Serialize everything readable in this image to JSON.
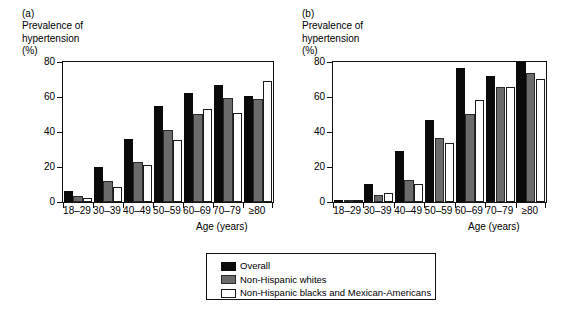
{
  "figure": {
    "legend": {
      "items": [
        {
          "key": "overall",
          "label": "Overall",
          "color": "#0a0a0a"
        },
        {
          "key": "whites",
          "label": "Non-Hispanic whites",
          "color": "#6b6b6b"
        },
        {
          "key": "blacks",
          "label": "Non-Hispanic blacks and Mexican-Americans",
          "color": "#ffffff"
        }
      ]
    }
  },
  "chart_data": [
    {
      "type": "bar",
      "panel": "(a)",
      "title": "Prevalence of\nhypertension\n(%)",
      "xlabel": "Age (years)",
      "ylabel": "Prevalence of hypertension (%)",
      "ylim": [
        0,
        80
      ],
      "yticks": [
        0,
        20,
        40,
        60,
        80
      ],
      "grid": false,
      "legend_position": "bottom-center-shared",
      "categories": [
        "18–29",
        "30–39",
        "40–49",
        "50–59",
        "60–69",
        "70–79",
        "≥80"
      ],
      "series": [
        {
          "name": "Overall",
          "color": "#0a0a0a",
          "values": [
            6.5,
            20.2,
            35.8,
            54.6,
            62.2,
            66.6,
            60.8
          ]
        },
        {
          "name": "Non-Hispanic whites",
          "color": "#6b6b6b",
          "values": [
            3.7,
            12.0,
            22.6,
            41.3,
            50.3,
            59.2,
            59.0
          ]
        },
        {
          "name": "Non-Hispanic blacks and Mexican-Americans",
          "color": "#ffffff",
          "values": [
            2.3,
            8.6,
            21.4,
            35.4,
            53.1,
            50.8,
            69.2
          ]
        }
      ]
    },
    {
      "type": "bar",
      "panel": "(b)",
      "title": "Prevalence of\nhypertension\n(%)",
      "xlabel": "Age (years)",
      "ylabel": "Prevalence of hypertension (%)",
      "ylim": [
        0,
        80
      ],
      "yticks": [
        0,
        20,
        40,
        60,
        80
      ],
      "grid": false,
      "legend_position": "bottom-center-shared",
      "categories": [
        "18–29",
        "30–39",
        "40–49",
        "50–59",
        "60–69",
        "70–79",
        "≥80"
      ],
      "series": [
        {
          "name": "Overall",
          "color": "#0a0a0a",
          "values": [
            1.4,
            10.5,
            29.4,
            46.6,
            76.7,
            71.8,
            80.0
          ]
        },
        {
          "name": "Non-Hispanic whites",
          "color": "#6b6b6b",
          "values": [
            0.9,
            4.1,
            12.5,
            36.5,
            50.2,
            66.0,
            73.8
          ]
        },
        {
          "name": "Non-Hispanic blacks and Mexican-Americans",
          "color": "#ffffff",
          "values": [
            0.8,
            5.4,
            10.4,
            33.6,
            58.4,
            66.0,
            70.2
          ]
        }
      ]
    }
  ]
}
